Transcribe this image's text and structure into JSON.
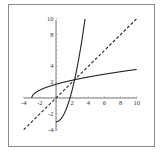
{
  "chart_data": {
    "type": "line",
    "title": "",
    "xlabel": "",
    "ylabel": "",
    "xlim": [
      -4,
      10
    ],
    "ylim": [
      -4,
      10
    ],
    "grid": false,
    "legend": null,
    "x_ticks": [
      "-4",
      "-2",
      "2",
      "4",
      "6",
      "8",
      "10"
    ],
    "y_ticks": [
      "10",
      "8",
      "4",
      "2",
      "-2",
      "-4"
    ],
    "series": [
      {
        "name": "f(x) = x^2 - 3 (x >= 0)",
        "style": "solid",
        "x": [
          0,
          0.5,
          1,
          1.5,
          2,
          2.3,
          2.5,
          3,
          3.5,
          3.6
        ],
        "y": [
          -3,
          -2.75,
          -2,
          -0.75,
          1,
          2.29,
          3.25,
          6,
          9.25,
          9.96
        ]
      },
      {
        "name": "f^-1(x) = sqrt(x + 3)",
        "style": "solid",
        "x": [
          -3,
          -2.75,
          -2,
          -0.75,
          1,
          2.29,
          3.25,
          6,
          9.25,
          10
        ],
        "y": [
          0,
          0.5,
          1,
          1.5,
          2,
          2.3,
          2.5,
          3,
          3.5,
          3.61
        ]
      },
      {
        "name": "y = x",
        "style": "dashed",
        "x": [
          -4,
          10
        ],
        "y": [
          -4,
          10
        ]
      }
    ],
    "annotations": [
      "intersection near (2.3, 2.3)"
    ]
  }
}
